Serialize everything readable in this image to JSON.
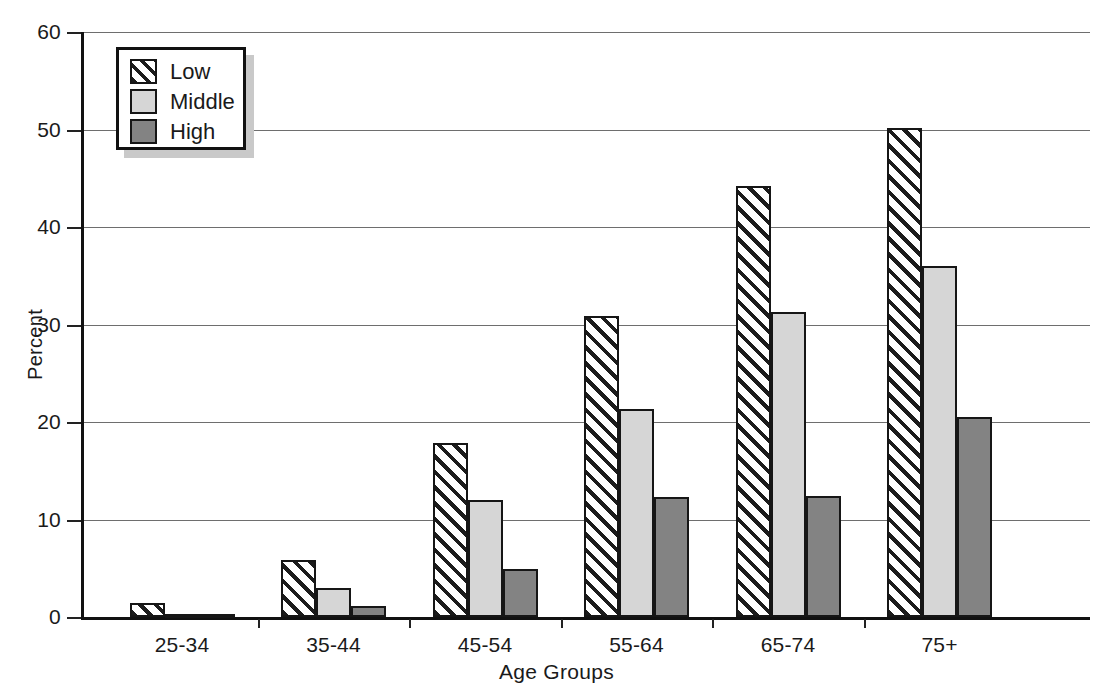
{
  "chart_data": {
    "type": "bar",
    "title": "",
    "xlabel": "Age Groups",
    "ylabel": "Percent",
    "categories": [
      "25-34",
      "35-44",
      "45-54",
      "55-64",
      "65-74",
      "75+"
    ],
    "series": [
      {
        "name": "Low",
        "values": [
          1.4,
          5.8,
          17.8,
          30.9,
          44.2,
          50.2
        ]
      },
      {
        "name": "Middle",
        "values": [
          0.3,
          3.0,
          12.0,
          21.3,
          31.3,
          36.0
        ]
      },
      {
        "name": "High",
        "values": [
          0.3,
          1.1,
          4.9,
          12.3,
          12.4,
          20.5
        ]
      }
    ],
    "ylim": [
      0,
      60
    ],
    "yticks": [
      0,
      10,
      20,
      30,
      40,
      50,
      60
    ],
    "ytick_labels": [
      "0",
      "10",
      "20",
      "30",
      "40",
      "50",
      "60"
    ],
    "grid": true,
    "legend_position": "upper left",
    "colors": {
      "Low": "#ffffff",
      "Middle": "#d6d6d6",
      "High": "#838383",
      "outline": "#161616",
      "gridline": "#6e6e6e",
      "axis": "#111111",
      "text": "#1a1a1a"
    }
  },
  "legend": {
    "entries": [
      {
        "label": "Low",
        "swatch": "hatched-swatch"
      },
      {
        "label": "Middle",
        "swatch": "light-gray-swatch"
      },
      {
        "label": "High",
        "swatch": "dark-gray-swatch"
      }
    ]
  }
}
